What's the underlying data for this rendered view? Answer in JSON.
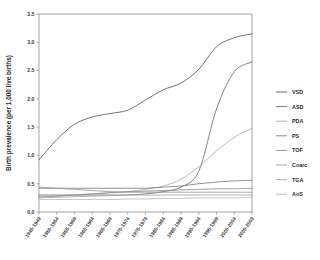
{
  "chart_data": {
    "type": "line",
    "title": "",
    "xlabel": "",
    "ylabel": "Birth prevalence (per 1,000 live births)",
    "ylim": [
      0.0,
      3.5
    ],
    "ytick_labels": [
      "0.0",
      "0.5",
      "1.0",
      "1.5",
      "2.0",
      "2.5",
      "3.0",
      "3.5"
    ],
    "ytick_values": [
      0.0,
      0.5,
      1.0,
      1.5,
      2.0,
      2.5,
      3.0,
      3.5
    ],
    "grid": false,
    "legend_position": "right",
    "categories": [
      "1945-1949",
      "1950-1954",
      "1955-1959",
      "1960-1964",
      "1965-1969",
      "1970-1974",
      "1975-1979",
      "1980-1984",
      "1985-1989",
      "1990-1994",
      "1995-1999",
      "2000-2004",
      "2005-2009"
    ],
    "series": [
      {
        "name": "VSD",
        "color": "#5a5a5a",
        "values": [
          0.92,
          1.28,
          1.55,
          1.68,
          1.74,
          1.8,
          1.98,
          2.16,
          2.28,
          2.52,
          2.92,
          3.08,
          3.15
        ]
      },
      {
        "name": "ASD",
        "color": "#6e6e6e",
        "values": [
          0.3,
          0.3,
          0.3,
          0.3,
          0.3,
          0.3,
          0.32,
          0.36,
          0.44,
          0.72,
          1.82,
          2.48,
          2.65
        ]
      },
      {
        "name": "PDA",
        "color": "#adadad",
        "values": [
          0.28,
          0.28,
          0.3,
          0.32,
          0.34,
          0.36,
          0.4,
          0.46,
          0.58,
          0.8,
          1.08,
          1.32,
          1.48
        ]
      },
      {
        "name": "PS",
        "color": "#7d7d7d",
        "values": [
          0.42,
          0.42,
          0.42,
          0.42,
          0.42,
          0.42,
          0.42,
          0.44,
          0.46,
          0.5,
          0.53,
          0.55,
          0.56
        ]
      },
      {
        "name": "TOF",
        "color": "#8c8c8c",
        "values": [
          0.26,
          0.28,
          0.3,
          0.32,
          0.34,
          0.36,
          0.37,
          0.38,
          0.39,
          0.4,
          0.41,
          0.41,
          0.42
        ]
      },
      {
        "name": "Coarc",
        "color": "#999999",
        "values": [
          0.44,
          0.42,
          0.4,
          0.38,
          0.36,
          0.35,
          0.35,
          0.35,
          0.35,
          0.35,
          0.35,
          0.35,
          0.35
        ]
      },
      {
        "name": "TGA",
        "color": "#a8a8a8",
        "values": [
          0.25,
          0.26,
          0.27,
          0.28,
          0.29,
          0.3,
          0.3,
          0.3,
          0.3,
          0.3,
          0.3,
          0.3,
          0.3
        ]
      },
      {
        "name": "AoS",
        "color": "#bcbcbc",
        "values": [
          0.22,
          0.22,
          0.22,
          0.22,
          0.22,
          0.23,
          0.23,
          0.24,
          0.24,
          0.25,
          0.25,
          0.25,
          0.26
        ]
      }
    ]
  }
}
